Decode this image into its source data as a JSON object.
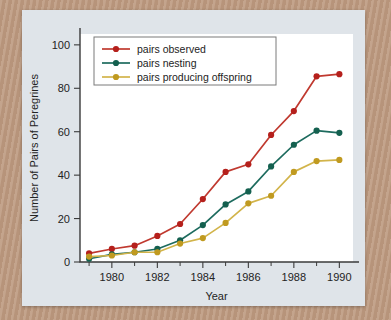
{
  "figure": {
    "panel_color": "#dfe4e9",
    "plot_background": "#ffffff",
    "background_description": "peregrine-falcon-feather-photo"
  },
  "chart_data": {
    "type": "line",
    "title": "",
    "xlabel": "Year",
    "ylabel": "Number of Pairs of Peregrines",
    "x": [
      1979,
      1980,
      1981,
      1982,
      1983,
      1984,
      1985,
      1986,
      1987,
      1988,
      1989,
      1990
    ],
    "xlim": [
      1978.6,
      1990.6
    ],
    "ylim": [
      0,
      105
    ],
    "xticks": [
      1980,
      1982,
      1984,
      1986,
      1988,
      1990
    ],
    "xticklabels": [
      "1980",
      "1982",
      "1984",
      "1986",
      "1988",
      "1990"
    ],
    "xminorticks": [
      1979,
      1981,
      1983,
      1985,
      1987,
      1989
    ],
    "yticks": [
      0,
      20,
      40,
      60,
      80,
      100
    ],
    "yticklabels": [
      "0",
      "20",
      "40",
      "60",
      "80",
      "100"
    ],
    "grid": false,
    "legend_position": "upper-left-inside",
    "series": [
      {
        "name": "pairs observed",
        "color": "#c0392f",
        "marker_color": "#b5201c",
        "values": [
          4,
          6,
          7.5,
          12,
          17.5,
          29,
          41.5,
          45,
          58.5,
          69.5,
          85.5,
          86.5
        ]
      },
      {
        "name": "pairs nesting",
        "color": "#1d6b5e",
        "marker_color": "#14604f",
        "values": [
          1.5,
          3.5,
          4.5,
          6,
          10,
          17,
          26.5,
          32.5,
          44,
          54,
          60.5,
          59.5
        ]
      },
      {
        "name": "pairs producing offspring",
        "color": "#d2b44a",
        "marker_color": "#c09a20",
        "values": [
          2.5,
          3,
          4.5,
          4.5,
          8.5,
          11,
          18,
          27,
          30.5,
          41.5,
          46.5,
          47
        ]
      }
    ]
  }
}
